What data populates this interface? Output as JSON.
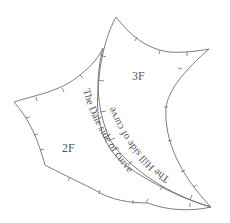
{
  "diagram": {
    "regions": [
      {
        "id": "3F",
        "label": "3F"
      },
      {
        "id": "2F",
        "label": "2F"
      }
    ],
    "curve_labels": {
      "hill": "The Hill side of curve",
      "dale": "The Dale side of curve"
    },
    "colors": {
      "stroke": "#6e6e6e",
      "text": "#555555",
      "background": "#ffffff"
    }
  }
}
